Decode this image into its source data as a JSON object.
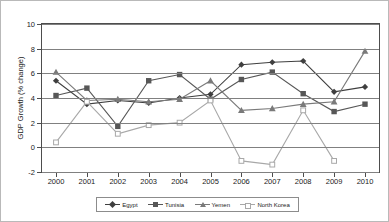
{
  "chart_data": {
    "type": "line",
    "title": "",
    "xlabel": "",
    "ylabel": "GDP Growth (% change)",
    "categories": [
      "2000",
      "2001",
      "2002",
      "2003",
      "2004",
      "2005",
      "2006",
      "2007",
      "2008",
      "2009",
      "2010"
    ],
    "x": [
      2000,
      2001,
      2002,
      2003,
      2004,
      2005,
      2006,
      2007,
      2008,
      2009,
      2010
    ],
    "ylim": [
      -2,
      10
    ],
    "yticks": [
      -2,
      0,
      2,
      4,
      6,
      8,
      10
    ],
    "ytick_labels": [
      "-2",
      "0",
      "2",
      "4",
      "6",
      "8",
      "10"
    ],
    "grid": true,
    "legend_position": "bottom",
    "series": [
      {
        "name": "Egypt",
        "marker": "diamond",
        "color": "#3f3f3f",
        "values": [
          5.4,
          3.5,
          3.8,
          3.6,
          4.0,
          4.3,
          6.7,
          6.9,
          7.0,
          4.5,
          4.9
        ]
      },
      {
        "name": "Tunisia",
        "marker": "square",
        "color": "#575757",
        "values": [
          4.2,
          4.8,
          1.7,
          5.4,
          5.9,
          3.9,
          5.5,
          6.1,
          4.35,
          2.9,
          3.5
        ]
      },
      {
        "name": "Yemen",
        "marker": "triangle",
        "color": "#7a7a7a",
        "values": [
          6.1,
          3.8,
          3.9,
          3.7,
          3.9,
          5.4,
          3.0,
          3.15,
          3.5,
          3.7,
          7.8
        ]
      },
      {
        "name": "North Korea",
        "marker": "open-square",
        "color": "#a8a8a8",
        "values": [
          0.4,
          3.7,
          1.1,
          1.8,
          2.0,
          3.8,
          -1.1,
          -1.4,
          3.0,
          -1.1,
          null
        ]
      }
    ]
  },
  "legend": {
    "items": [
      {
        "label": "Egypt"
      },
      {
        "label": "Tunisia"
      },
      {
        "label": "Yemen"
      },
      {
        "label": "North Korea"
      }
    ]
  },
  "axes": {
    "y_title": "GDP Growth (% change)"
  }
}
